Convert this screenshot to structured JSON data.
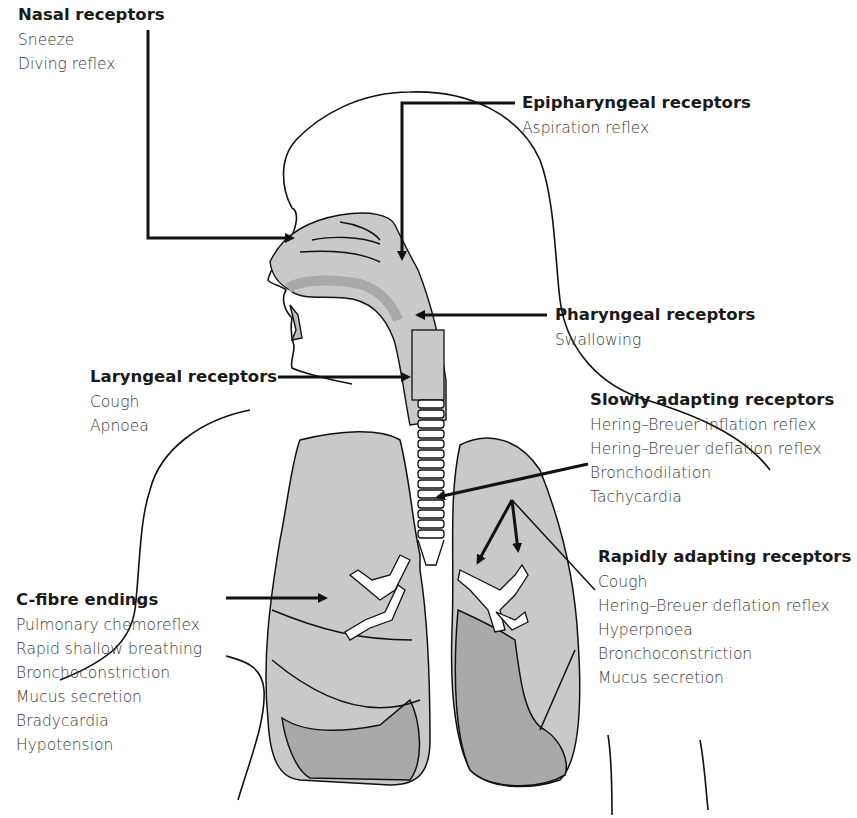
{
  "diagram": {
    "colors": {
      "tissue": "#c9c9c9",
      "tissue_dark": "#a9a9a9",
      "outline": "#111111",
      "text": "#333333"
    }
  },
  "labels": [
    {
      "id": "nasal",
      "title": "Nasal receptors",
      "items": [
        "Sneeze",
        "Diving reflex"
      ]
    },
    {
      "id": "epipharyngeal",
      "title": "Epipharyngeal receptors",
      "items": [
        "Aspiration reflex"
      ]
    },
    {
      "id": "pharyngeal",
      "title": "Pharyngeal receptors",
      "items": [
        "Swallowing"
      ]
    },
    {
      "id": "laryngeal",
      "title": "Laryngeal receptors",
      "items": [
        "Cough",
        "Apnoea"
      ]
    },
    {
      "id": "slowly",
      "title": "Slowly adapting receptors",
      "items": [
        "Hering–Breuer inflation reflex",
        "Hering–Breuer deflation reflex",
        "Bronchodilation",
        "Tachycardia"
      ]
    },
    {
      "id": "rapidly",
      "title": "Rapidly adapting receptors",
      "items": [
        "Cough",
        "Hering–Breuer deflation reflex",
        "Hyperpnoea",
        "Bronchoconstriction",
        "Mucus secretion"
      ]
    },
    {
      "id": "cfibre",
      "title": "C-fibre endings",
      "items": [
        "Pulmonary chemoreflex",
        "Rapid shallow breathing",
        "Bronchoconstriction",
        "Mucus secretion",
        "Bradycardia",
        "Hypotension"
      ]
    }
  ]
}
